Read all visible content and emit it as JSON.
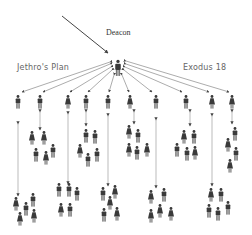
{
  "labels": {
    "deacon": "Deacon",
    "left": "Jethro's Plan",
    "right": "Exodus 18"
  },
  "colors": {
    "figure": "#3a3a3a",
    "line": "#888888",
    "background": "#ffffff"
  },
  "structure": {
    "leader": {
      "x": 118,
      "y": 68
    },
    "top_row": [
      {
        "x": 18,
        "y": 102,
        "type": "male"
      },
      {
        "x": 40,
        "y": 102,
        "type": "male"
      },
      {
        "x": 68,
        "y": 102,
        "type": "female"
      },
      {
        "x": 86,
        "y": 102,
        "type": "male"
      },
      {
        "x": 108,
        "y": 102,
        "type": "male"
      },
      {
        "x": 130,
        "y": 102,
        "type": "female"
      },
      {
        "x": 156,
        "y": 102,
        "type": "male"
      },
      {
        "x": 186,
        "y": 102,
        "type": "male"
      },
      {
        "x": 212,
        "y": 102,
        "type": "female"
      },
      {
        "x": 232,
        "y": 102,
        "type": "female"
      }
    ],
    "mid_groups": [
      {
        "cx": 42,
        "cy": 145,
        "figures": [
          {
            "x": 32,
            "y": 138,
            "t": "female"
          },
          {
            "x": 44,
            "y": 138,
            "t": "female"
          },
          {
            "x": 53,
            "y": 151,
            "t": "male"
          },
          {
            "x": 36,
            "y": 155,
            "t": "male"
          },
          {
            "x": 46,
            "y": 158,
            "t": "female"
          }
        ]
      },
      {
        "cx": 90,
        "cy": 145,
        "figures": [
          {
            "x": 86,
            "y": 136,
            "t": "male"
          },
          {
            "x": 95,
            "y": 137,
            "t": "male"
          },
          {
            "x": 80,
            "y": 151,
            "t": "female"
          },
          {
            "x": 97,
            "y": 155,
            "t": "male"
          },
          {
            "x": 88,
            "y": 160,
            "t": "male"
          }
        ]
      },
      {
        "cx": 135,
        "cy": 140,
        "figures": [
          {
            "x": 129,
            "y": 132,
            "t": "female"
          },
          {
            "x": 138,
            "y": 136,
            "t": "male"
          },
          {
            "x": 129,
            "y": 150,
            "t": "female"
          },
          {
            "x": 137,
            "y": 153,
            "t": "male"
          },
          {
            "x": 147,
            "y": 150,
            "t": "female"
          }
        ]
      },
      {
        "cx": 188,
        "cy": 145,
        "figures": [
          {
            "x": 184,
            "y": 137,
            "t": "female"
          },
          {
            "x": 194,
            "y": 137,
            "t": "male"
          },
          {
            "x": 177,
            "y": 150,
            "t": "male"
          },
          {
            "x": 187,
            "y": 154,
            "t": "male"
          },
          {
            "x": 195,
            "y": 153,
            "t": "female"
          }
        ]
      },
      {
        "cx": 232,
        "cy": 145,
        "figures": [
          {
            "x": 235,
            "y": 130,
            "t": "male"
          },
          {
            "x": 228,
            "y": 143,
            "t": "female"
          },
          {
            "x": 236,
            "y": 153,
            "t": "male"
          },
          {
            "x": 230,
            "y": 165,
            "t": "female"
          }
        ]
      }
    ],
    "bottom_groups": [
      {
        "figures": [
          {
            "x": 33,
            "y": 200,
            "t": "male"
          },
          {
            "x": 16,
            "y": 204,
            "t": "female"
          },
          {
            "x": 26,
            "y": 209,
            "t": "male"
          },
          {
            "x": 20,
            "y": 219,
            "t": "female"
          },
          {
            "x": 34,
            "y": 216,
            "t": "female"
          }
        ]
      },
      {
        "figures": [
          {
            "x": 59,
            "y": 190,
            "t": "male"
          },
          {
            "x": 69,
            "y": 190,
            "t": "male"
          },
          {
            "x": 77,
            "y": 194,
            "t": "male"
          },
          {
            "x": 61,
            "y": 210,
            "t": "female"
          },
          {
            "x": 70,
            "y": 210,
            "t": "male"
          }
        ]
      },
      {
        "figures": [
          {
            "x": 103,
            "y": 194,
            "t": "male"
          },
          {
            "x": 115,
            "y": 192,
            "t": "female"
          },
          {
            "x": 110,
            "y": 203,
            "t": "female"
          },
          {
            "x": 104,
            "y": 215,
            "t": "male"
          },
          {
            "x": 117,
            "y": 214,
            "t": "female"
          }
        ]
      },
      {
        "figures": [
          {
            "x": 151,
            "y": 197,
            "t": "female"
          },
          {
            "x": 164,
            "y": 195,
            "t": "male"
          },
          {
            "x": 151,
            "y": 216,
            "t": "female"
          },
          {
            "x": 160,
            "y": 211,
            "t": "female"
          },
          {
            "x": 171,
            "y": 214,
            "t": "female"
          }
        ]
      },
      {
        "figures": [
          {
            "x": 211,
            "y": 195,
            "t": "female"
          },
          {
            "x": 221,
            "y": 195,
            "t": "male"
          },
          {
            "x": 209,
            "y": 211,
            "t": "male"
          },
          {
            "x": 218,
            "y": 214,
            "t": "male"
          },
          {
            "x": 228,
            "y": 208,
            "t": "male"
          }
        ]
      }
    ]
  }
}
